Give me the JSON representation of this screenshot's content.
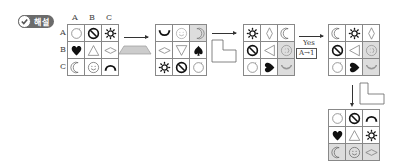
{
  "badge": {
    "label": "해설",
    "icon": "check-circle-icon"
  },
  "grid1": {
    "col_labels": [
      "A",
      "B",
      "C"
    ],
    "row_labels": [
      "A",
      "B",
      "C"
    ],
    "cells": [
      [
        "circle-open",
        "no-sign",
        "sun"
      ],
      [
        "heart",
        "triangle-up",
        "diamond-h"
      ],
      [
        "moon-left",
        "smiley",
        "arch"
      ]
    ],
    "shaded": []
  },
  "op1": {
    "shape": "trapezoid",
    "fill": "#cccccc"
  },
  "grid2": {
    "cells": [
      [
        "smile-curve",
        "smiley-light",
        "moon-right"
      ],
      [
        "diamond-h",
        "triangle-down",
        "spade"
      ],
      [
        "sun",
        "no-sign",
        "circle-open"
      ]
    ],
    "shaded": [
      [
        0,
        2
      ]
    ]
  },
  "op2": {
    "shape": "L-shape"
  },
  "grid3": {
    "cells": [
      [
        "sun",
        "diamond-v",
        "moon-left"
      ],
      [
        "no-sign",
        "triangle-left",
        "smiley-side"
      ],
      [
        "circle-open",
        "heart-right",
        "smile-moon"
      ]
    ],
    "shaded": [
      [
        1,
        2
      ],
      [
        2,
        2
      ]
    ]
  },
  "op3": {
    "label_top": "Yes",
    "label_box": "A→1"
  },
  "grid4": {
    "cells": [
      [
        "moon-left",
        "sun",
        "diamond-v"
      ],
      [
        "no-sign",
        "triangle-left",
        "smiley-side"
      ],
      [
        "circle-open",
        "heart-right",
        "smile-moon"
      ]
    ],
    "shaded": [
      [
        1,
        2
      ],
      [
        2,
        2
      ]
    ]
  },
  "op4": {
    "shape": "L-shape"
  },
  "grid5": {
    "cells": [
      [
        "circle-open",
        "no-sign",
        "arch"
      ],
      [
        "heart",
        "triangle-up",
        "sun"
      ],
      [
        "moon-left",
        "smiley",
        "diamond-h"
      ]
    ],
    "shaded": [
      [
        2,
        0
      ],
      [
        2,
        1
      ],
      [
        2,
        2
      ]
    ]
  }
}
